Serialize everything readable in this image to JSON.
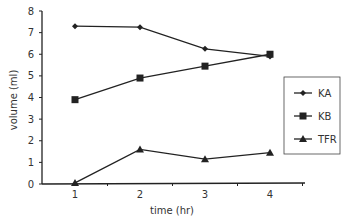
{
  "chart_data": {
    "type": "line",
    "title": "",
    "xlabel": "time (hr)",
    "ylabel": "volume (ml)",
    "x": [
      1,
      2,
      3,
      4
    ],
    "xticks": [
      "1",
      "2",
      "3",
      "4"
    ],
    "yticks": [
      "0",
      "1",
      "2",
      "3",
      "4",
      "5",
      "6",
      "7",
      "8"
    ],
    "ylim": [
      0,
      8
    ],
    "grid": false,
    "legend_position": "right",
    "series": [
      {
        "name": "KA",
        "marker": "diamond",
        "values": [
          7.3,
          7.25,
          6.25,
          5.9
        ]
      },
      {
        "name": "KB",
        "marker": "square",
        "values": [
          3.9,
          4.9,
          5.45,
          6.0
        ]
      },
      {
        "name": "TFR",
        "marker": "triangle",
        "values": [
          0.05,
          1.6,
          1.15,
          1.45
        ]
      }
    ]
  },
  "colors": {
    "line": "#222222",
    "axis": "#222222"
  }
}
